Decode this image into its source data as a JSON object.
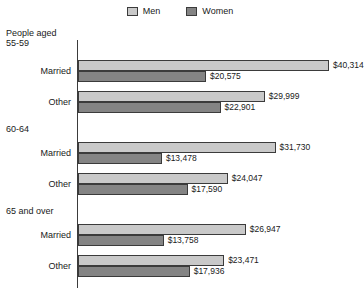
{
  "legend": {
    "entries": [
      {
        "label": "Men",
        "color": "#c9c9c9"
      },
      {
        "label": "Women",
        "color": "#848484"
      }
    ]
  },
  "axis": {
    "header_line1": "People aged",
    "header_line2": "55-59"
  },
  "chart_data": {
    "type": "bar",
    "orientation": "horizontal",
    "title": "",
    "xlabel": "",
    "ylabel": "",
    "xlim": [
      0,
      40314
    ],
    "grid": false,
    "legend_position": "top-center",
    "series": [
      {
        "name": "Men",
        "color": "#c9c9c9",
        "values": [
          40314,
          29999,
          31730,
          24047,
          26947,
          23471
        ],
        "labels": [
          "$40,314",
          "$29,999",
          "$31,730",
          "$24,047",
          "$26,947",
          "$23,471"
        ]
      },
      {
        "name": "Women",
        "color": "#848484",
        "values": [
          20575,
          22901,
          13478,
          17590,
          13758,
          17936
        ],
        "labels": [
          "$20,575",
          "$22,901",
          "$13,478",
          "$17,590",
          "$13,758",
          "$17,936"
        ]
      }
    ],
    "categories": [
      "Married",
      "Other",
      "Married",
      "Other",
      "Married",
      "Other"
    ],
    "groups": [
      {
        "header": "People aged 55-59",
        "header_line1": "People aged",
        "header_line2": "55-59",
        "rows": [
          {
            "label": "Married",
            "men": 40314,
            "women": 20575,
            "men_label": "$40,314",
            "women_label": "$20,575"
          },
          {
            "label": "Other",
            "men": 29999,
            "women": 22901,
            "men_label": "$29,999",
            "women_label": "$22,901"
          }
        ]
      },
      {
        "header": "60-64",
        "rows": [
          {
            "label": "Married",
            "men": 31730,
            "women": 13478,
            "men_label": "$31,730",
            "women_label": "$13,478"
          },
          {
            "label": "Other",
            "men": 24047,
            "women": 17590,
            "men_label": "$24,047",
            "women_label": "$17,590"
          }
        ]
      },
      {
        "header": "65 and over",
        "rows": [
          {
            "label": "Married",
            "men": 26947,
            "women": 13758,
            "men_label": "$26,947",
            "women_label": "$13,758"
          },
          {
            "label": "Other",
            "men": 23471,
            "women": 17936,
            "men_label": "$23,471",
            "women_label": "$17,936"
          }
        ]
      }
    ]
  }
}
